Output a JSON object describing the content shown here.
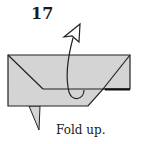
{
  "step": {
    "number": "17",
    "instruction": "Fold up."
  },
  "diagram": {
    "paper_color": "#d4d4d4",
    "line_color": "#222222",
    "arrow": {
      "type": "fold-up arrow",
      "fill": "#ffffff"
    }
  }
}
